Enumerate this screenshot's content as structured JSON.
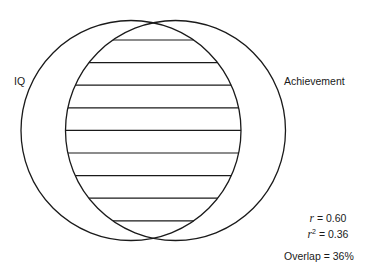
{
  "diagram": {
    "type": "venn",
    "circles": [
      {
        "id": "iq",
        "label": "IQ",
        "cx": 131,
        "cy": 130.5,
        "r": 110
      },
      {
        "id": "achievement",
        "label": "Achievement",
        "cx": 175.5,
        "cy": 130.5,
        "r": 110
      }
    ],
    "overlap_hatch": {
      "lines": 9,
      "start_y": 40,
      "spacing": 22.6
    },
    "stroke_color": "#1a1a1a",
    "background": "#ffffff"
  },
  "labels": {
    "left": "IQ",
    "right": "Achievement"
  },
  "stats": {
    "r_symbol": "r",
    "r_value": "= 0.60",
    "r2_symbol": "r",
    "r2_exp": "2",
    "r2_value": "= 0.36",
    "overlap": "Overlap = 36%"
  }
}
